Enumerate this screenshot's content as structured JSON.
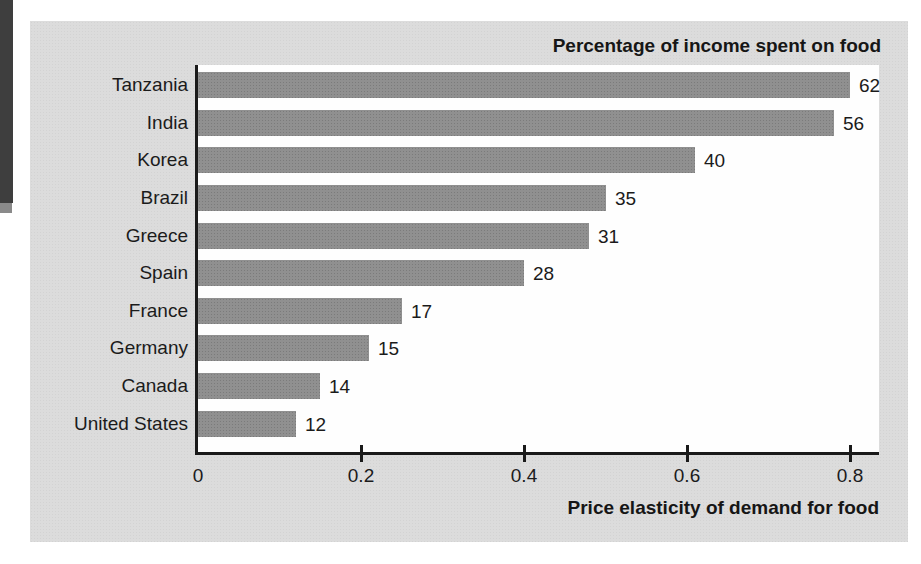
{
  "figure": {
    "panel_bg": "#dcdcdc",
    "plot_bg": "#fefefe",
    "edge_band_color": "#3e3e3e"
  },
  "chart_data": {
    "type": "bar",
    "orientation": "horizontal",
    "title": "Percentage of income spent on food",
    "xlabel": "Price elasticity of demand for food",
    "ylabel": "",
    "categories": [
      "Tanzania",
      "India",
      "Korea",
      "Brazil",
      "Greece",
      "Spain",
      "France",
      "Germany",
      "Canada",
      "United States"
    ],
    "series": [
      {
        "name": "Price elasticity of demand for food",
        "values": [
          0.8,
          0.78,
          0.61,
          0.5,
          0.48,
          0.4,
          0.25,
          0.21,
          0.15,
          0.12
        ]
      },
      {
        "name": "Percentage of income spent on food",
        "values": [
          62,
          56,
          40,
          35,
          31,
          28,
          17,
          15,
          14,
          12
        ]
      }
    ],
    "bar_end_labels": [
      "62",
      "56",
      "40",
      "35",
      "31",
      "28",
      "17",
      "15",
      "14",
      "12"
    ],
    "x_ticks": [
      0,
      0.2,
      0.4,
      0.6,
      0.8
    ],
    "x_tick_labels": [
      "0",
      "0.2",
      "0.4",
      "0.6",
      "0.8"
    ],
    "xlim": [
      0,
      0.84
    ],
    "grid": false,
    "legend": "none",
    "colors": {
      "bar": "#909090",
      "axis": "#1a1a1a",
      "text": "#1b1b1b"
    }
  }
}
